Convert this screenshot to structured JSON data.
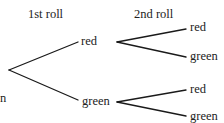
{
  "diagram": {
    "type": "probability-tree",
    "headers": {
      "first": "1st roll",
      "second": "2nd roll"
    },
    "edge_label_fragment": "n",
    "first_level": [
      {
        "label": "red",
        "children": [
          {
            "label": "red"
          },
          {
            "label": "green"
          }
        ]
      },
      {
        "label": "green",
        "children": [
          {
            "label": "red"
          },
          {
            "label": "green"
          }
        ]
      }
    ],
    "colors": {
      "line": "#1a1a1a",
      "text": "#222222"
    }
  }
}
